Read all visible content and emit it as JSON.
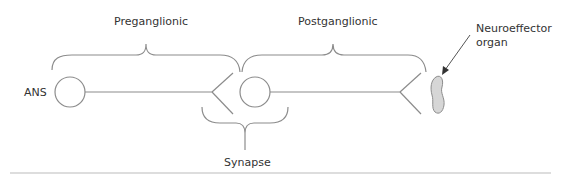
{
  "diagram": {
    "labels": {
      "preganglionic": "Preganglionic",
      "postganglionic": "Postganglionic",
      "ans": "ANS",
      "synapse": "Synapse",
      "organ_line1": "Neuroeffector",
      "organ_line2": "organ"
    },
    "colors": {
      "stroke": "#8c8c8c",
      "organ_fill": "#d6d6d6",
      "text": "#333333"
    },
    "nodes": [
      {
        "id": "ans-ganglion",
        "type": "circle"
      },
      {
        "id": "preganglionic-axon",
        "type": "line"
      },
      {
        "id": "preganglionic-terminal",
        "type": "fork"
      },
      {
        "id": "postganglionic-cell-body",
        "type": "circle"
      },
      {
        "id": "postganglionic-axon",
        "type": "line"
      },
      {
        "id": "postganglionic-terminal",
        "type": "fork"
      },
      {
        "id": "neuroeffector-organ",
        "type": "blob"
      }
    ],
    "edges": [
      {
        "from": "ans-ganglion",
        "to": "postganglionic-cell-body",
        "label": "Preganglionic"
      },
      {
        "from": "postganglionic-cell-body",
        "to": "neuroeffector-organ",
        "label": "Postganglionic"
      },
      {
        "between": [
          "preganglionic-terminal",
          "postganglionic-cell-body"
        ],
        "label": "Synapse"
      }
    ]
  }
}
